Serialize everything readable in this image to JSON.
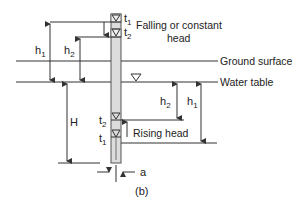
{
  "figure": {
    "caption": "(b)",
    "colors": {
      "line": "#333333",
      "casing_fill": "#dcdcdc",
      "background": "#ffffff"
    }
  },
  "labels": {
    "falling_head_line1": "Falling or constant",
    "falling_head_line2": "head",
    "ground_surface": "Ground surface",
    "water_table": "Water table",
    "rising_head": "Rising head",
    "t1": "t",
    "t1_sub": "1",
    "t2": "t",
    "t2_sub": "2",
    "h1": "h",
    "h1_sub": "1",
    "h2": "h",
    "h2_sub": "2",
    "H": "H",
    "a": "a"
  },
  "icons": {
    "water_level_marker": "inverted-triangle-icon"
  }
}
